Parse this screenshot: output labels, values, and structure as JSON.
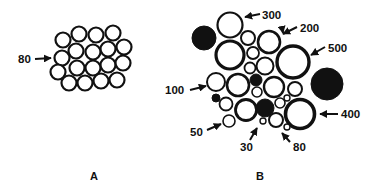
{
  "figure": {
    "panels": [
      {
        "id": "A",
        "label": "A",
        "description": "Uniform packing of equal-size circles",
        "annotations": [
          {
            "text": "80"
          }
        ]
      },
      {
        "id": "B",
        "label": "B",
        "description": "Mixed packing of circles of varying sizes, some filled black",
        "annotations": [
          {
            "text": "300"
          },
          {
            "text": "200"
          },
          {
            "text": "500"
          },
          {
            "text": "100"
          },
          {
            "text": "400"
          },
          {
            "text": "50"
          },
          {
            "text": "30"
          },
          {
            "text": "80"
          }
        ]
      }
    ],
    "colors": {
      "stroke": "#111111",
      "fill_open": "#ffffff",
      "fill_solid": "#111111"
    }
  }
}
